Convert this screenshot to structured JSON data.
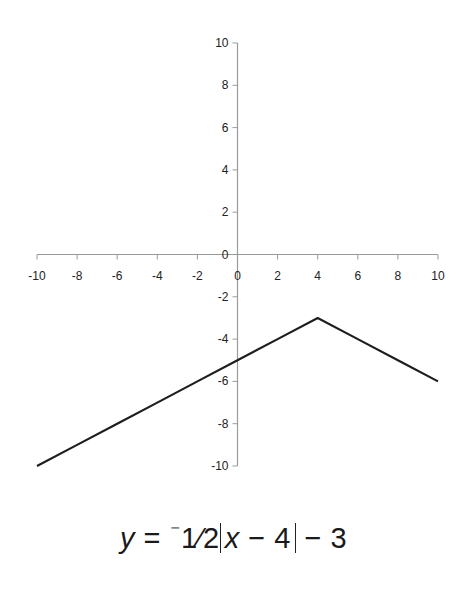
{
  "chart_data": {
    "type": "line",
    "title": "",
    "xlabel": "",
    "ylabel": "",
    "xlim": [
      -10,
      10
    ],
    "ylim": [
      -10,
      10
    ],
    "grid": false,
    "legend": null,
    "x_ticks": [
      -10,
      -8,
      -6,
      -4,
      -2,
      0,
      2,
      4,
      6,
      8,
      10
    ],
    "y_ticks": [
      -10,
      -8,
      -6,
      -4,
      -2,
      0,
      2,
      4,
      6,
      8,
      10
    ],
    "series": [
      {
        "name": "y = -1/2|x - 4| - 3",
        "x": [
          -10,
          -8,
          -6,
          -4,
          -2,
          0,
          2,
          4,
          6,
          8,
          10
        ],
        "y": [
          -10,
          -9,
          -8,
          -7,
          -6,
          -5,
          -4,
          -3,
          -4,
          -5,
          -6
        ]
      }
    ],
    "annotations": [
      "y = ⁻1/2|x − 4| − 3"
    ]
  },
  "equation": {
    "y": "y",
    "equals": " = ",
    "neg": "⁻",
    "coef": "1⁄2",
    "x": "x",
    "minus4": " − 4",
    "tail": " − 3"
  }
}
